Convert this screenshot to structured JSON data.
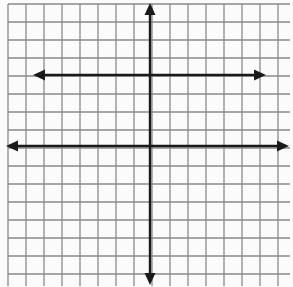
{
  "diagram": {
    "type": "coordinate-grid",
    "background": "#fbfbfb",
    "grid": {
      "x0": 8,
      "y0": 4,
      "x1": 290,
      "y1": 286,
      "cell": 18,
      "color": "#8a8a8a",
      "line_width": 1.3
    },
    "axes": {
      "color": "#1a1a1a",
      "horizontal": {
        "y": 146,
        "x_start": 6,
        "x_end": 289,
        "arrows": "both"
      },
      "vertical": {
        "x": 150,
        "y_start": 3,
        "y_end": 285,
        "arrows": "both"
      }
    },
    "lines": [
      {
        "name": "horizontal-line-above-axis",
        "y": 75,
        "x_start": 33,
        "x_end": 266,
        "arrows": "both",
        "color": "#1a1a1a"
      }
    ]
  }
}
